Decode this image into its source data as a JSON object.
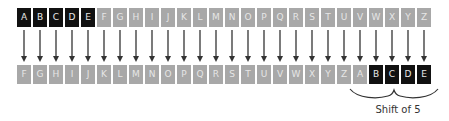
{
  "diagram": {
    "plain_row": {
      "letters": [
        "A",
        "B",
        "C",
        "D",
        "E",
        "F",
        "G",
        "H",
        "I",
        "J",
        "K",
        "L",
        "M",
        "N",
        "O",
        "P",
        "Q",
        "R",
        "S",
        "T",
        "U",
        "V",
        "W",
        "X",
        "Y",
        "Z"
      ],
      "highlighted": [
        0,
        1,
        2,
        3,
        4
      ]
    },
    "cipher_row": {
      "letters": [
        "F",
        "G",
        "H",
        "I",
        "J",
        "K",
        "L",
        "M",
        "N",
        "O",
        "P",
        "Q",
        "R",
        "S",
        "T",
        "U",
        "V",
        "W",
        "X",
        "Y",
        "Z",
        "A",
        "B",
        "C",
        "D",
        "E"
      ],
      "highlighted": [
        22,
        23,
        24,
        25
      ]
    },
    "shift": 5,
    "caption": "Shift of 5",
    "colors": {
      "highlight_fill": "#111111",
      "normal_fill": "#a8a8a8",
      "arrow": "#333333"
    }
  }
}
